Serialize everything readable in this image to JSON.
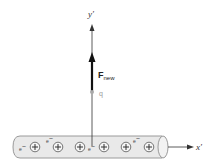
{
  "diagram": {
    "type": "physics-force-on-charge-near-wire",
    "axes": {
      "y_label": "y′",
      "x_label": "x′"
    },
    "force": {
      "label_main": "F",
      "label_sub": "new",
      "direction": "up"
    },
    "charge": {
      "label": "q"
    },
    "wire": {
      "ion_symbol": "+",
      "electron_symbol": "e",
      "electron_sup": "−",
      "ion_count": 6,
      "electron_count": 4
    },
    "colors": {
      "wire_fill": "#e9e9e9",
      "wire_stroke": "#9a9a9a",
      "axis": "#333333",
      "force_arrow": "#111111",
      "charge": "#a9a9a9",
      "charge_label": "#9a9a9a"
    }
  }
}
